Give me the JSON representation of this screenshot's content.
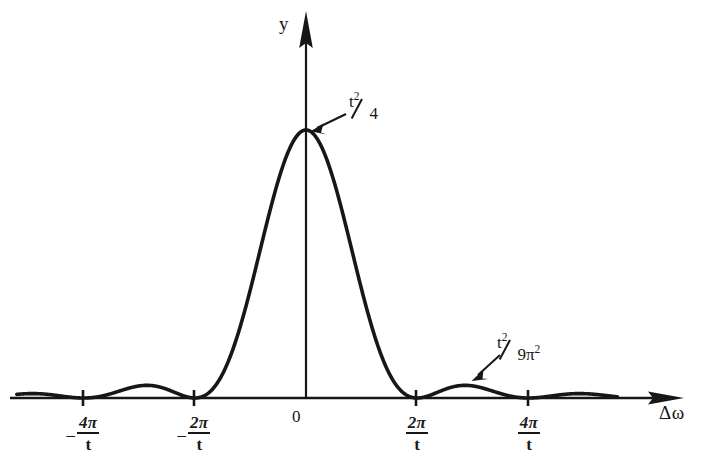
{
  "figure": {
    "kind": "line-plot",
    "background_color": "#ffffff",
    "ink_color": "#171717"
  },
  "axes": {
    "y_label": "y",
    "x_label": "Δω",
    "origin_label": "0",
    "x_arrow": "arrow-right",
    "y_arrow": "arrow-up"
  },
  "ticks": [
    {
      "id": "tick-neg-4pi-t",
      "sign": "–",
      "numerator": "4π",
      "denominator": "t",
      "value": -4
    },
    {
      "id": "tick-neg-2pi-t",
      "sign": "–",
      "numerator": "2π",
      "denominator": "t",
      "value": -2
    },
    {
      "id": "tick-2pi-t",
      "sign": "",
      "numerator": "2π",
      "denominator": "t",
      "value": 2
    },
    {
      "id": "tick-4pi-t",
      "sign": "",
      "numerator": "4π",
      "denominator": "t",
      "value": 4
    }
  ],
  "annotations": [
    {
      "id": "peak-annotation",
      "numerator_base": "t",
      "numerator_exp": "2",
      "denominator": "4",
      "denominator_exp": "",
      "text": "t²/4",
      "points_to": "main-lobe-peak"
    },
    {
      "id": "sidelobe-annotation",
      "numerator_base": "t",
      "numerator_exp": "2",
      "denominator": "9π",
      "denominator_exp": "2",
      "text": "t²/9π²",
      "points_to": "first-side-lobe-peak"
    }
  ],
  "chart_data": {
    "type": "line",
    "title": "",
    "xlabel": "Δω",
    "ylabel": "y",
    "function": "y = (t^2/4) * sinc^2(Δω t / 2)",
    "xlim": [
      -5.2,
      5.6
    ],
    "ylim": [
      0,
      1.12
    ],
    "grid": false,
    "legend": false,
    "x_tick_values": [
      -4,
      -2,
      0,
      2,
      4
    ],
    "x_tick_labels": [
      "–4π/t",
      "–2π/t",
      "0",
      "2π/t",
      "4π/t"
    ],
    "y_tick_values": [],
    "y_tick_labels": [],
    "peak_value": 1.0,
    "peak_label": "t²/4",
    "side_lobe_value": 0.045,
    "side_lobe_label": "t²/9π²",
    "zero_crossings": [
      -4,
      -2,
      2,
      4
    ],
    "series": [
      {
        "name": "sinc-squared",
        "x": [
          -5.2,
          -5.0,
          -4.8,
          -4.6,
          -4.4,
          -4.2,
          -4.0,
          -3.8,
          -3.6,
          -3.4,
          -3.2,
          -3.0,
          -2.8,
          -2.6,
          -2.4,
          -2.2,
          -2.0,
          -1.8,
          -1.6,
          -1.4,
          -1.2,
          -1.0,
          -0.8,
          -0.6,
          -0.4,
          -0.2,
          0.0,
          0.2,
          0.4,
          0.6,
          0.8,
          1.0,
          1.2,
          1.4,
          1.6,
          1.8,
          2.0,
          2.2,
          2.4,
          2.6,
          2.8,
          3.0,
          3.2,
          3.4,
          3.6,
          3.8,
          4.0,
          4.2,
          4.4,
          4.6,
          4.8,
          5.0,
          5.2
        ],
        "y": [
          0.01,
          0.004,
          0.0,
          0.003,
          0.01,
          0.018,
          0.0,
          0.012,
          0.028,
          0.041,
          0.045,
          0.045,
          0.039,
          0.026,
          0.011,
          0.001,
          0.0,
          0.017,
          0.062,
          0.133,
          0.226,
          0.336,
          0.455,
          0.577,
          0.695,
          0.8,
          1.0,
          0.8,
          0.695,
          0.577,
          0.455,
          0.336,
          0.226,
          0.133,
          0.062,
          0.017,
          0.0,
          0.001,
          0.011,
          0.026,
          0.039,
          0.045,
          0.045,
          0.041,
          0.028,
          0.012,
          0.0,
          0.018,
          0.01,
          0.003,
          0.0,
          0.004,
          0.01
        ]
      }
    ]
  }
}
